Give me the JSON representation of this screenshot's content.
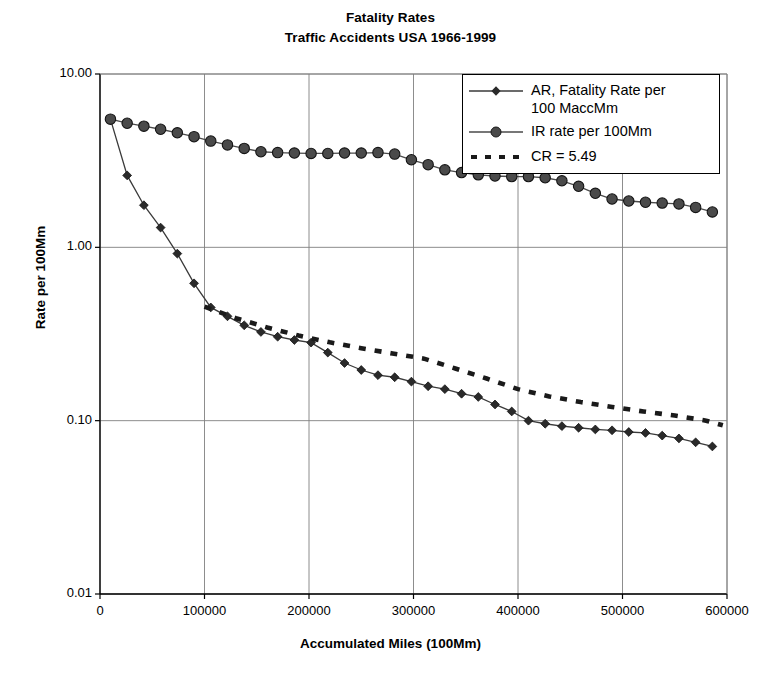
{
  "chart_data": {
    "type": "line",
    "title": "Fatality Rates",
    "subtitle": "Traffic Accidents USA 1966-1999",
    "xlabel": "Accumulated Miles (100Mm)",
    "ylabel": "Rate per 100Mm",
    "xlim": [
      0,
      600000
    ],
    "ylim": [
      0.01,
      10.0
    ],
    "yscale": "log",
    "xscale": "linear",
    "grid": true,
    "legend_position": "top-right",
    "xticks": [
      0,
      100000,
      200000,
      300000,
      400000,
      500000,
      600000
    ],
    "xtick_labels": [
      "0",
      "100000",
      "200000",
      "300000",
      "400000",
      "500000",
      "600000"
    ],
    "yticks": [
      0.01,
      0.1,
      1.0,
      10.0
    ],
    "ytick_labels": [
      "0.01",
      "0.10",
      "1.00",
      "10.00"
    ],
    "series": [
      {
        "name": "AR, Fatality Rate per 100 MaccMm",
        "marker": "diamond",
        "linestyle": "solid",
        "color": "#3a3a3a",
        "x": [
          10000,
          26000,
          42000,
          58000,
          74000,
          90000,
          106000,
          122000,
          138000,
          154000,
          170000,
          186000,
          202000,
          218000,
          234000,
          250000,
          266000,
          282000,
          298000,
          314000,
          330000,
          346000,
          362000,
          378000,
          394000,
          410000,
          426000,
          442000,
          458000,
          474000,
          490000,
          506000,
          522000,
          538000,
          554000,
          570000,
          586000
        ],
        "y": [
          5.49,
          2.6,
          1.75,
          1.3,
          0.92,
          0.62,
          0.45,
          0.4,
          0.355,
          0.325,
          0.305,
          0.292,
          0.282,
          0.247,
          0.215,
          0.196,
          0.183,
          0.178,
          0.168,
          0.158,
          0.152,
          0.143,
          0.137,
          0.124,
          0.113,
          0.1,
          0.096,
          0.093,
          0.091,
          0.089,
          0.088,
          0.086,
          0.085,
          0.082,
          0.079,
          0.075,
          0.071
        ]
      },
      {
        "name": "IR rate per 100Mm",
        "marker": "circle",
        "linestyle": "solid",
        "color": "#4a4a4a",
        "x": [
          10000,
          26000,
          42000,
          58000,
          74000,
          90000,
          106000,
          122000,
          138000,
          154000,
          170000,
          186000,
          202000,
          218000,
          234000,
          250000,
          266000,
          282000,
          298000,
          314000,
          330000,
          346000,
          362000,
          378000,
          394000,
          410000,
          426000,
          442000,
          458000,
          474000,
          490000,
          506000,
          522000,
          538000,
          554000,
          570000,
          586000
        ],
        "y": [
          5.49,
          5.2,
          5.0,
          4.8,
          4.58,
          4.35,
          4.1,
          3.9,
          3.72,
          3.56,
          3.52,
          3.5,
          3.48,
          3.48,
          3.5,
          3.5,
          3.52,
          3.45,
          3.2,
          3.0,
          2.8,
          2.7,
          2.62,
          2.58,
          2.56,
          2.56,
          2.52,
          2.42,
          2.25,
          2.05,
          1.9,
          1.85,
          1.82,
          1.8,
          1.78,
          1.7,
          1.6
        ]
      },
      {
        "name": "CR = 5.49",
        "marker": "none",
        "linestyle": "dashed",
        "color": "#1a1a1a",
        "x": [
          100000,
          130000,
          160000,
          190000,
          220000,
          250000,
          280000,
          310000,
          340000,
          370000,
          400000,
          430000,
          460000,
          490000,
          520000,
          550000,
          580000,
          596000
        ],
        "y": [
          0.455,
          0.39,
          0.345,
          0.31,
          0.283,
          0.262,
          0.244,
          0.228,
          0.2,
          0.175,
          0.152,
          0.138,
          0.128,
          0.12,
          0.113,
          0.107,
          0.1,
          0.094
        ]
      }
    ]
  },
  "legend": {
    "entries": [
      {
        "label_line1": "AR, Fatality Rate per",
        "label_line2": "100 MaccMm",
        "key": "line-diamond-key"
      },
      {
        "label_line1": "IR rate per 100Mm",
        "label_line2": "",
        "key": "line-circle-key"
      },
      {
        "label_line1": "CR = 5.49",
        "label_line2": "",
        "key": "dashed-line-key"
      }
    ]
  },
  "colors": {
    "axis": "#000000",
    "grid": "#808080",
    "ar_series": "#3a3a3a",
    "ir_series": "#4a4a4a",
    "cr_series": "#1a1a1a",
    "background": "#ffffff"
  }
}
